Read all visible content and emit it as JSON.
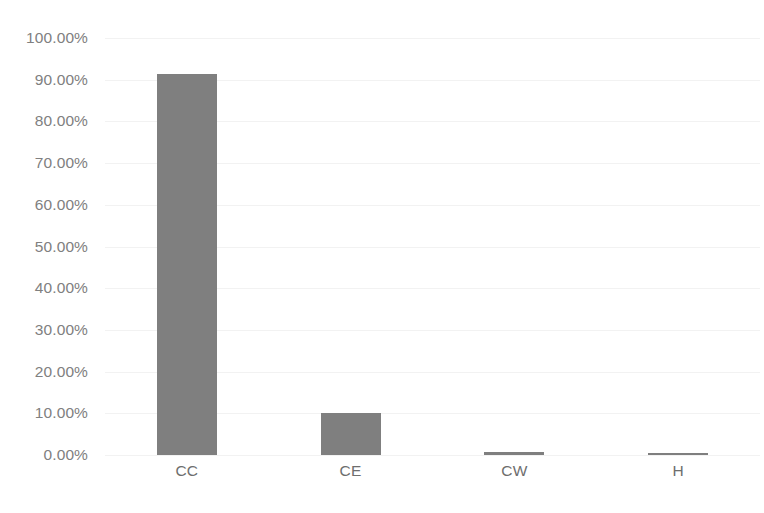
{
  "chart_data": {
    "type": "bar",
    "title": "",
    "subtitle": "",
    "xlabel": "",
    "ylabel": "",
    "categories": [
      "CC",
      "CE",
      "CW",
      "H"
    ],
    "values": [
      91.3,
      10.1,
      0.7,
      0.4
    ],
    "value_format": "percent",
    "ylim": [
      0,
      100
    ],
    "y_ticks": [
      0,
      10,
      20,
      30,
      40,
      50,
      60,
      70,
      80,
      90,
      100
    ],
    "y_tick_labels": [
      "0.00%",
      "10.00%",
      "20.00%",
      "30.00%",
      "40.00%",
      "50.00%",
      "60.00%",
      "70.00%",
      "80.00%",
      "90.00%",
      "100.00%"
    ],
    "series": [
      {
        "name": "",
        "values": [
          91.3,
          10.1,
          0.7,
          0.4
        ],
        "color": "#7f7f7f"
      }
    ],
    "grid": false,
    "legend": false,
    "legend_position": "none",
    "data_labels": false
  },
  "colors": {
    "bar": "#7f7f7f",
    "axis_text": "#808080",
    "category_text": "#6e6e6e",
    "gridline": "#f2f2f2",
    "background": "#ffffff"
  },
  "artifact": {
    "bottom_text": ""
  }
}
